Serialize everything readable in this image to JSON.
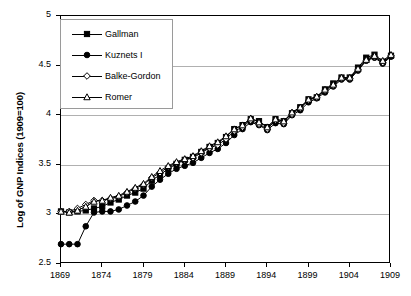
{
  "chart_data": {
    "type": "line",
    "title": "",
    "xlabel": "",
    "ylabel": "Log of GNP Indices (1909=100)",
    "xlim": [
      1869,
      1909
    ],
    "ylim": [
      2.5,
      5
    ],
    "grid": true,
    "legend_position": "top-left",
    "ytick_labels": [
      "5",
      "4.5",
      "4",
      "3.5",
      "3",
      "2.5"
    ],
    "ytick_values": [
      5,
      4.5,
      4,
      3.5,
      3,
      2.5
    ],
    "xtick_labels": [
      "1869",
      "1874",
      "1879",
      "1884",
      "1889",
      "1894",
      "1899",
      "1904",
      "1909"
    ],
    "xtick_values": [
      1869,
      1874,
      1879,
      1884,
      1889,
      1894,
      1899,
      1904,
      1909
    ],
    "x": [
      1869,
      1870,
      1871,
      1872,
      1873,
      1874,
      1875,
      1876,
      1877,
      1878,
      1879,
      1880,
      1881,
      1882,
      1883,
      1884,
      1885,
      1886,
      1887,
      1888,
      1889,
      1890,
      1891,
      1892,
      1893,
      1894,
      1895,
      1896,
      1897,
      1898,
      1899,
      1900,
      1901,
      1902,
      1903,
      1904,
      1905,
      1906,
      1907,
      1908,
      1909
    ],
    "series": [
      {
        "name": "Gallman",
        "marker": "filled-square",
        "color": "#000000",
        "values": [
          3.03,
          3.02,
          3.03,
          3.04,
          3.06,
          3.08,
          3.12,
          3.15,
          3.19,
          3.22,
          3.26,
          3.34,
          3.4,
          3.46,
          3.51,
          3.55,
          3.58,
          3.63,
          3.68,
          3.72,
          3.78,
          3.86,
          3.9,
          3.96,
          3.94,
          3.88,
          3.96,
          3.94,
          4.02,
          4.08,
          4.16,
          4.18,
          4.26,
          4.32,
          4.38,
          4.38,
          4.48,
          4.58,
          4.61,
          4.54,
          4.6
        ]
      },
      {
        "name": "Kuznets I",
        "marker": "filled-circle",
        "color": "#000000",
        "values": [
          2.7,
          2.7,
          2.7,
          2.88,
          3.02,
          3.03,
          3.03,
          3.05,
          3.09,
          3.13,
          3.19,
          3.28,
          3.35,
          3.41,
          3.46,
          3.49,
          3.52,
          3.57,
          3.62,
          3.66,
          3.72,
          3.8,
          3.86,
          3.93,
          3.9,
          3.85,
          3.92,
          3.91,
          4.0,
          4.05,
          4.13,
          4.17,
          4.23,
          4.29,
          4.36,
          4.36,
          4.45,
          4.55,
          4.58,
          4.52,
          4.59
        ]
      },
      {
        "name": "Balke-Gordon",
        "marker": "open-diamond",
        "color": "#000000",
        "values": [
          3.03,
          3.03,
          3.06,
          3.1,
          3.14,
          3.14,
          3.16,
          3.18,
          3.22,
          3.26,
          3.3,
          3.37,
          3.42,
          3.48,
          3.52,
          3.55,
          3.57,
          3.62,
          3.67,
          3.7,
          3.76,
          3.84,
          3.88,
          3.95,
          3.91,
          3.86,
          3.95,
          3.92,
          4.01,
          4.07,
          4.15,
          4.18,
          4.25,
          4.3,
          4.37,
          4.37,
          4.46,
          4.55,
          4.59,
          4.53,
          4.6
        ]
      },
      {
        "name": "Romer",
        "marker": "open-triangle",
        "color": "#000000",
        "values": [
          3.03,
          3.02,
          3.04,
          3.08,
          3.13,
          3.14,
          3.17,
          3.19,
          3.23,
          3.27,
          3.31,
          3.38,
          3.44,
          3.49,
          3.53,
          3.56,
          3.59,
          3.64,
          3.69,
          3.73,
          3.79,
          3.86,
          3.9,
          3.97,
          3.93,
          3.88,
          3.96,
          3.94,
          4.03,
          4.08,
          4.16,
          4.19,
          4.26,
          4.31,
          4.38,
          4.38,
          4.47,
          4.56,
          4.6,
          4.55,
          4.61
        ]
      }
    ]
  },
  "legend": {
    "items": [
      {
        "label": "Gallman",
        "marker": "filled-square"
      },
      {
        "label": "Kuznets I",
        "marker": "filled-circle"
      },
      {
        "label": "Balke-Gordon",
        "marker": "open-diamond"
      },
      {
        "label": "Romer",
        "marker": "open-triangle"
      }
    ]
  }
}
